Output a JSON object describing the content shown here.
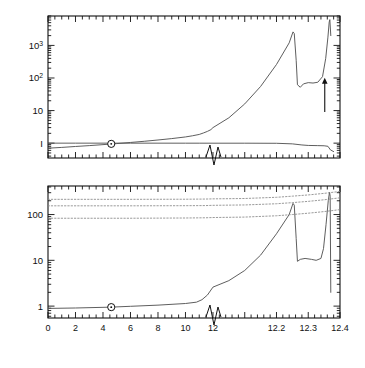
{
  "figure": {
    "caption_x_axis": "Time (billions of years)",
    "panels": [
      {
        "id": "top",
        "ylabel": "Mass, luminosity",
        "ytick_labels": [
          "I",
          "10",
          "10²",
          "10³"
        ]
      },
      {
        "id": "bottom",
        "ylabel": "Radius",
        "ytick_labels": [
          "1",
          "10",
          "100"
        ]
      }
    ]
  },
  "annotations": {
    "luminosity": "Luminosity",
    "mass": "Mass",
    "red_giant": "Red\ngiant",
    "red_giant_line1": "Red",
    "red_giant_line2": "giant",
    "asymptotic_line1": "Asymptotic",
    "asymptotic_line2": "red",
    "asymptotic_line3": "giant",
    "suns_surface_line1": "Sun's",
    "suns_surface_line2": "surface",
    "orbit_of": "Orbit of:",
    "orbit_earth": "Earth",
    "orbit_venus": "Venus",
    "orbit_mercury": "Mercury",
    "sun_symbol": "☉"
  },
  "colors": {
    "ink": "#111111",
    "curve": "#555555",
    "dotted": "#888888",
    "frame": "#222222"
  },
  "chart_data": {
    "type": "line",
    "title": "",
    "xlabel": "Time (billions of years)",
    "x_axis": {
      "broken": true,
      "segments": [
        {
          "from": 0,
          "to": 12,
          "tick_labels": [
            "0",
            "2",
            "4",
            "6",
            "8",
            "10",
            "12"
          ],
          "tick_values": [
            0,
            2,
            4,
            6,
            8,
            10,
            12
          ],
          "minor_step": 0.5
        },
        {
          "from": 12,
          "to": 12.4,
          "tick_labels": [
            "12.2",
            "12.3",
            "12.4"
          ],
          "tick_values": [
            12.2,
            12.3,
            12.4
          ],
          "minor_step": 0.02
        }
      ],
      "break_marker": "zigzag at 12"
    },
    "panels": [
      {
        "id": "top",
        "ylabel": "Mass, luminosity",
        "yscale": "log",
        "ylim": [
          0.35,
          8000
        ],
        "ytick_values": [
          1,
          10,
          100,
          1000
        ],
        "ytick_labels": [
          "I",
          "10",
          "10²",
          "10³"
        ],
        "grid": false,
        "legend": "inline-labels",
        "series": [
          {
            "name": "Luminosity",
            "units": "solar luminosities",
            "points": [
              [
                0,
                0.7
              ],
              [
                1,
                0.74
              ],
              [
                2,
                0.79
              ],
              [
                3,
                0.84
              ],
              [
                4,
                0.9
              ],
              [
                4.6,
                0.94
              ],
              [
                5,
                0.97
              ],
              [
                6,
                1.05
              ],
              [
                7,
                1.14
              ],
              [
                8,
                1.25
              ],
              [
                9,
                1.38
              ],
              [
                10,
                1.55
              ],
              [
                10.5,
                1.68
              ],
              [
                11,
                1.85
              ],
              [
                11.3,
                2.05
              ],
              [
                11.6,
                2.3
              ],
              [
                11.85,
                2.6
              ],
              [
                12.0,
                3.0
              ],
              [
                12.05,
                6
              ],
              [
                12.1,
                16
              ],
              [
                12.15,
                55
              ],
              [
                12.2,
                260
              ],
              [
                12.24,
                1200
              ],
              [
                12.252,
                2600
              ],
              [
                12.256,
                2300
              ],
              [
                12.262,
                350
              ],
              [
                12.266,
                62
              ],
              [
                12.275,
                52
              ],
              [
                12.285,
                66
              ],
              [
                12.3,
                72
              ],
              [
                12.315,
                70
              ],
              [
                12.33,
                74
              ],
              [
                12.345,
                110
              ],
              [
                12.355,
                400
              ],
              [
                12.362,
                1800
              ],
              [
                12.366,
                5200
              ],
              [
                12.368,
                6200
              ],
              [
                12.371,
                2000
              ]
            ]
          },
          {
            "name": "Mass",
            "units": "solar masses",
            "points": [
              [
                0,
                1.0
              ],
              [
                2,
                1.0
              ],
              [
                4,
                1.0
              ],
              [
                4.6,
                1.0
              ],
              [
                6,
                0.999
              ],
              [
                8,
                0.999
              ],
              [
                10,
                0.998
              ],
              [
                11,
                0.998
              ],
              [
                12,
                0.997
              ],
              [
                12.1,
                0.996
              ],
              [
                12.2,
                0.99
              ],
              [
                12.25,
                0.95
              ],
              [
                12.28,
                0.88
              ],
              [
                12.3,
                0.85
              ],
              [
                12.33,
                0.84
              ],
              [
                12.35,
                0.83
              ],
              [
                12.362,
                0.8
              ],
              [
                12.37,
                0.62
              ],
              [
                12.38,
                0.55
              ]
            ]
          }
        ],
        "annotations": [
          {
            "text": "Luminosity",
            "x": 8.6,
            "y": 4.5
          },
          {
            "text": "Mass",
            "x": 7.0,
            "y": 0.52
          },
          {
            "text": "Red giant",
            "x": 12.16,
            "y": 1600
          },
          {
            "text": "Asymptotic red giant",
            "x": 12.3,
            "y": 14,
            "arrow_to": [
              12.362,
              120
            ]
          },
          {
            "text": "☉ present Sun",
            "x": 4.6,
            "y": 1.0,
            "marker": "sun-symbol"
          }
        ]
      },
      {
        "id": "bottom",
        "ylabel": "Radius",
        "yscale": "log",
        "ylim": [
          0.55,
          420
        ],
        "ytick_values": [
          1,
          10,
          100
        ],
        "ytick_labels": [
          "1",
          "10",
          "100"
        ],
        "grid": false,
        "series": [
          {
            "name": "Sun's surface",
            "units": "solar radii",
            "points": [
              [
                0,
                0.89
              ],
              [
                2,
                0.91
              ],
              [
                4,
                0.94
              ],
              [
                4.6,
                0.95
              ],
              [
                6,
                0.99
              ],
              [
                8,
                1.05
              ],
              [
                10,
                1.14
              ],
              [
                10.8,
                1.22
              ],
              [
                11.2,
                1.38
              ],
              [
                11.6,
                1.75
              ],
              [
                12.0,
                2.6
              ],
              [
                12.05,
                3.6
              ],
              [
                12.1,
                6.0
              ],
              [
                12.15,
                13
              ],
              [
                12.2,
                38
              ],
              [
                12.24,
                100
              ],
              [
                12.252,
                175
              ],
              [
                12.256,
                160
              ],
              [
                12.262,
                30
              ],
              [
                12.266,
                9.5
              ],
              [
                12.275,
                10.5
              ],
              [
                12.29,
                11
              ],
              [
                12.31,
                10.5
              ],
              [
                12.325,
                10
              ],
              [
                12.34,
                11
              ],
              [
                12.348,
                18
              ],
              [
                12.356,
                60
              ],
              [
                12.363,
                200
              ],
              [
                12.367,
                310
              ],
              [
                12.369,
                250
              ],
              [
                12.371,
                2.0
              ]
            ]
          },
          {
            "name": "Orbit of Earth",
            "style": "dotted",
            "points": [
              [
                0,
                215
              ],
              [
                6,
                215
              ],
              [
                10,
                216
              ],
              [
                11.5,
                218
              ],
              [
                12.0,
                220
              ],
              [
                12.1,
                224
              ],
              [
                12.2,
                238
              ],
              [
                12.25,
                252
              ],
              [
                12.3,
                268
              ],
              [
                12.35,
                290
              ],
              [
                12.4,
                320
              ]
            ]
          },
          {
            "name": "Orbit of Venus",
            "style": "dotted",
            "points": [
              [
                0,
                155
              ],
              [
                6,
                155
              ],
              [
                10,
                156
              ],
              [
                11.5,
                157
              ],
              [
                12.0,
                159
              ],
              [
                12.1,
                162
              ],
              [
                12.2,
                172
              ],
              [
                12.25,
                182
              ],
              [
                12.3,
                194
              ],
              [
                12.35,
                210
              ],
              [
                12.4,
                232
              ]
            ]
          },
          {
            "name": "Orbit of Mercury",
            "style": "dotted",
            "points": [
              [
                0,
                83
              ],
              [
                6,
                83
              ],
              [
                10,
                84
              ],
              [
                11.5,
                85
              ],
              [
                12.0,
                86
              ],
              [
                12.1,
                88
              ],
              [
                12.2,
                94
              ],
              [
                12.25,
                100
              ],
              [
                12.3,
                107
              ],
              [
                12.35,
                116
              ],
              [
                12.4,
                128
              ]
            ]
          }
        ],
        "annotations": [
          {
            "text": "Orbit of:",
            "x": 0.6,
            "y": 380
          },
          {
            "text": "Earth",
            "x": 0.6,
            "y": 255
          },
          {
            "text": "Venus",
            "x": 0.6,
            "y": 175
          },
          {
            "text": "Mercury",
            "x": 0.6,
            "y": 118
          },
          {
            "text": "Sun's surface",
            "x": 7.4,
            "y": 2.6
          },
          {
            "text": "☉ present Sun",
            "x": 4.6,
            "y": 0.95,
            "marker": "sun-symbol"
          }
        ]
      }
    ]
  }
}
